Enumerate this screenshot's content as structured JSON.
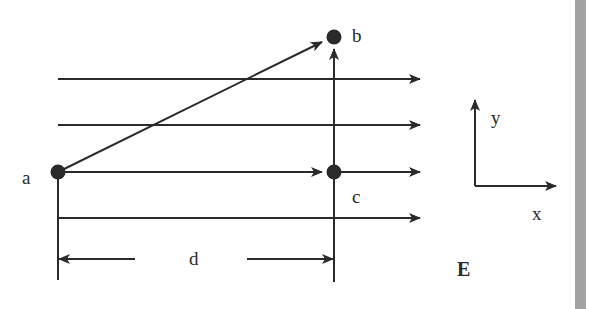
{
  "diagram": {
    "points": {
      "a": {
        "label": "a"
      },
      "b": {
        "label": "b"
      },
      "c": {
        "label": "c"
      }
    },
    "distance_label": "d",
    "field_label": "E",
    "axes": {
      "x_label": "x",
      "y_label": "y"
    },
    "colors": {
      "ink": "#2a2a2a",
      "side_bar": "#a3a3a3",
      "background": "#ffffff"
    }
  }
}
